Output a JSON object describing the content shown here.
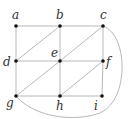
{
  "diagram": {
    "type": "graph",
    "nodes": [
      {
        "id": "a",
        "label": "a",
        "x": 16,
        "y": 26,
        "lx": 12,
        "ly": 19
      },
      {
        "id": "b",
        "label": "b",
        "x": 60,
        "y": 26,
        "lx": 56,
        "ly": 19
      },
      {
        "id": "c",
        "label": "c",
        "x": 103,
        "y": 26,
        "lx": 100,
        "ly": 19
      },
      {
        "id": "d",
        "label": "d",
        "x": 16,
        "y": 61,
        "lx": 3,
        "ly": 66
      },
      {
        "id": "e",
        "label": "e",
        "x": 60,
        "y": 61,
        "lx": 51,
        "ly": 57
      },
      {
        "id": "f",
        "label": "f",
        "x": 103,
        "y": 61,
        "lx": 106,
        "ly": 66
      },
      {
        "id": "g",
        "label": "g",
        "x": 16,
        "y": 96,
        "lx": 6,
        "ly": 107
      },
      {
        "id": "h",
        "label": "h",
        "x": 60,
        "y": 96,
        "lx": 56,
        "ly": 110
      },
      {
        "id": "i",
        "label": "i",
        "x": 102,
        "y": 96,
        "lx": 94,
        "ly": 110
      }
    ],
    "edges": [
      [
        "a",
        "b"
      ],
      [
        "b",
        "c"
      ],
      [
        "d",
        "e"
      ],
      [
        "e",
        "f"
      ],
      [
        "g",
        "h"
      ],
      [
        "h",
        "i"
      ],
      [
        "a",
        "d"
      ],
      [
        "d",
        "g"
      ],
      [
        "b",
        "e"
      ],
      [
        "e",
        "h"
      ],
      [
        "c",
        "f"
      ],
      [
        "f",
        "i"
      ],
      [
        "d",
        "b"
      ],
      [
        "e",
        "c"
      ],
      [
        "g",
        "e"
      ],
      [
        "h",
        "f"
      ]
    ],
    "curved_edges": [
      {
        "from": "c",
        "to": "g",
        "path": "M103,26 C128,34 130,100 100,113 C75,122 35,118 16,96"
      }
    ]
  }
}
